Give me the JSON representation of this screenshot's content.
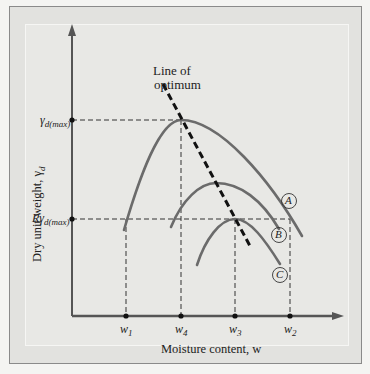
{
  "figure": {
    "y_axis_label": "Dry unit weight, γ",
    "y_axis_label_sub": "d",
    "x_axis_label": "Moisture content, w",
    "y_ticks": [
      {
        "label": "γ",
        "sub": "d(max)",
        "prefix": ""
      },
      {
        "label": "γ",
        "sub": "d(max)",
        "prefix": "R"
      }
    ],
    "x_ticks": [
      {
        "label": "w",
        "sub": "1"
      },
      {
        "label": "w",
        "sub": "4"
      },
      {
        "label": "w",
        "sub": "3"
      },
      {
        "label": "w",
        "sub": "2"
      }
    ],
    "annotation_line1": "Line of",
    "annotation_line2": "optimum",
    "curve_labels": [
      "A",
      "B",
      "C"
    ],
    "colors": {
      "curve": "#6b6b6b",
      "axis": "#555555",
      "optimum": "#111111",
      "background": "#e8e8e5"
    }
  }
}
